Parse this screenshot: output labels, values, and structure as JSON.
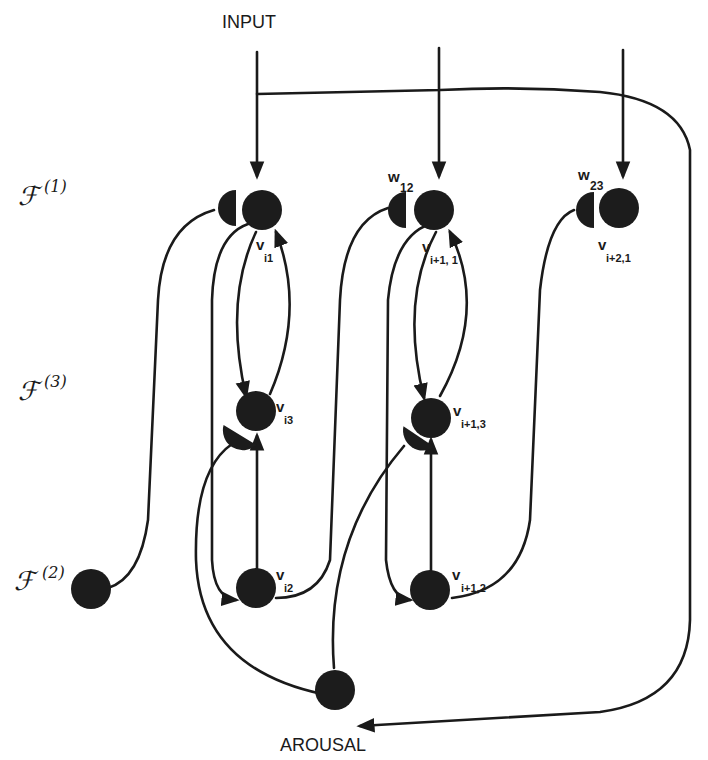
{
  "diagram": {
    "title": "",
    "input_label": "INPUT",
    "arousal_label": "AROUSAL",
    "layers": [
      {
        "id": "F1",
        "symbol": "ℱ",
        "sup": "(1)"
      },
      {
        "id": "F3",
        "symbol": "ℱ",
        "sup": "(3)"
      },
      {
        "id": "F2",
        "symbol": "ℱ",
        "sup": "(2)"
      }
    ],
    "weights": [
      {
        "id": "w12",
        "base": "w",
        "sub": "12"
      },
      {
        "id": "w23",
        "base": "w",
        "sub": "23"
      }
    ],
    "nodes": [
      {
        "id": "v_i1",
        "base": "v",
        "sub": "i1",
        "layer": "F1"
      },
      {
        "id": "v_i+1,1",
        "base": "v",
        "sub": "i+1, 1",
        "layer": "F1"
      },
      {
        "id": "v_i+2,1",
        "base": "v",
        "sub": "i+2,1",
        "layer": "F1"
      },
      {
        "id": "v_i3",
        "base": "v",
        "sub": "i3",
        "layer": "F3"
      },
      {
        "id": "v_i+1,3",
        "base": "v",
        "sub": "i+1,3",
        "layer": "F3"
      },
      {
        "id": "v_i2",
        "base": "v",
        "sub": "i2",
        "layer": "F2"
      },
      {
        "id": "v_i+1,2",
        "base": "v",
        "sub": "i+1,2",
        "layer": "F2"
      },
      {
        "id": "F2_left",
        "base": "",
        "sub": "",
        "layer": "F2"
      },
      {
        "id": "arousal",
        "base": "",
        "sub": "",
        "layer": "arousal"
      }
    ]
  }
}
